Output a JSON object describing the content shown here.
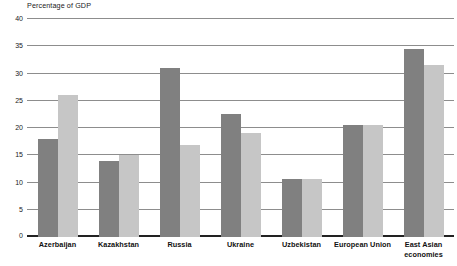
{
  "chart_data": {
    "type": "bar",
    "title": "Percentage of GDP",
    "xlabel": "",
    "ylabel": "Percentage of GDP",
    "ylim": [
      0,
      40
    ],
    "yticks": [
      0,
      5,
      10,
      15,
      20,
      25,
      30,
      35,
      40
    ],
    "grid": true,
    "legend": "none",
    "categories": [
      "Azerbaijan",
      "Kazakhstan",
      "Russia",
      "Ukraine",
      "Uzbekistan",
      "European Union",
      "East Asian economies"
    ],
    "series": [
      {
        "name": "series-1",
        "color": "#808080",
        "values": [
          18.0,
          14.0,
          31.0,
          22.5,
          10.7,
          20.5,
          34.5
        ]
      },
      {
        "name": "series-2",
        "color": "#c6c6c6",
        "values": [
          26.0,
          15.0,
          16.8,
          19.0,
          10.7,
          20.5,
          31.5
        ]
      }
    ]
  },
  "style": {
    "gridline_color": "#8d8d8d",
    "baseline_color": "#222222",
    "text_color": "#1a1a1a",
    "background": "#ffffff"
  }
}
